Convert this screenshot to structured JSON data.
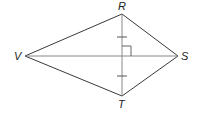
{
  "figure": {
    "type": "kite",
    "vertices": {
      "R": {
        "label": "R",
        "x": 122,
        "y": 14
      },
      "S": {
        "label": "S",
        "x": 178,
        "y": 56
      },
      "T": {
        "label": "T",
        "x": 122,
        "y": 96
      },
      "V": {
        "label": "V",
        "x": 25,
        "y": 56
      }
    },
    "marks": {
      "congruent_ticks": "segments from R and T to diagonal intersection",
      "right_angle": "diagonals RT and VS perpendicular"
    }
  }
}
